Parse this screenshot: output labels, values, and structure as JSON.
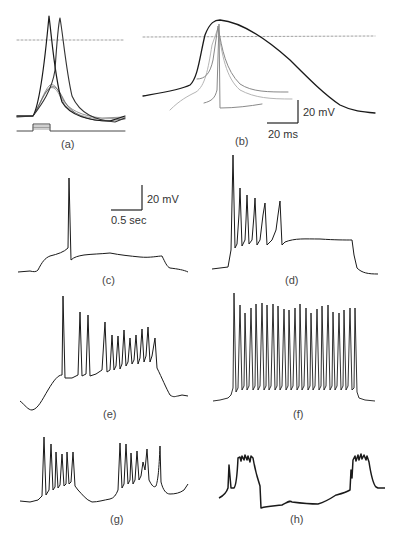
{
  "figure": {
    "panels": [
      {
        "id": "a",
        "label": "(a)"
      },
      {
        "id": "b",
        "label": "(b)"
      },
      {
        "id": "c",
        "label": "(c)"
      },
      {
        "id": "d",
        "label": "(d)"
      },
      {
        "id": "e",
        "label": "(e)"
      },
      {
        "id": "f",
        "label": "(f)"
      },
      {
        "id": "g",
        "label": "(g)"
      },
      {
        "id": "h",
        "label": "(h)"
      }
    ],
    "scale_bars": {
      "b": {
        "voltage": "20 mV",
        "time": "20 ms"
      },
      "c": {
        "voltage": "20 mV",
        "time": "0.5 sec"
      }
    },
    "colors": {
      "trace_dark": "#1a1a1a",
      "trace_mid": "#777777",
      "trace_light": "#b5b5b5",
      "dashed": "#888888"
    }
  }
}
